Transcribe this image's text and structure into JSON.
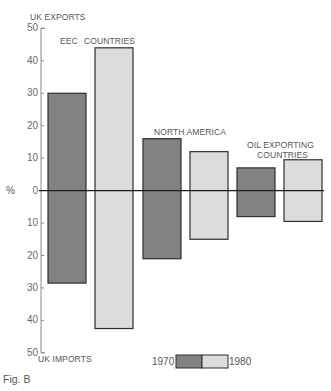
{
  "chart_data": {
    "type": "bar",
    "title": "",
    "caption": "Fig. B",
    "ylabel": "%",
    "y_top_label": "UK EXPORTS",
    "y_bottom_label": "UK IMPORTS",
    "ylim": [
      -50,
      50
    ],
    "yticks": [
      50,
      40,
      30,
      20,
      10,
      0,
      10,
      20,
      30,
      40,
      50
    ],
    "grid": false,
    "legend_position": "bottom",
    "categories": [
      "EEC COUNTRIES",
      "NORTH AMERICA",
      "OIL EXPORTING COUNTRIES"
    ],
    "series": [
      {
        "name": "1970",
        "color": "#828282",
        "exports": [
          30,
          16,
          7
        ],
        "imports": [
          28.5,
          21,
          8
        ]
      },
      {
        "name": "1980",
        "color": "#dcdcdc",
        "exports": [
          44,
          12,
          9.5
        ],
        "imports": [
          42.5,
          15,
          9.5
        ]
      }
    ]
  },
  "labels": {
    "uk_exports": "UK EXPORTS",
    "uk_imports": "UK IMPORTS",
    "percent": "%",
    "eec": "EEC",
    "countries": "COUNTRIES",
    "north_america": "NORTH AMERICA",
    "oil_line1": "OIL EXPORTING",
    "oil_line2": "COUNTRIES",
    "fig": "Fig. B",
    "legend_1970": "1970",
    "legend_1980": "1980"
  }
}
